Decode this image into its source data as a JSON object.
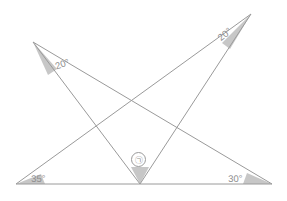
{
  "figure": {
    "width": 287,
    "height": 201,
    "background_color": "#ffffff",
    "line_color": "#9a9a9a",
    "wedge_fill_color": "#bdbdbd",
    "label_color": "#8d8d8d"
  },
  "points": {
    "upper_left": {
      "name": "A",
      "x": 33,
      "y": 42
    },
    "upper_right": {
      "name": "B",
      "x": 251,
      "y": 14
    },
    "bottom_left": {
      "name": "C",
      "x": 16,
      "y": 184
    },
    "bottom_center": {
      "name": "D",
      "x": 140,
      "y": 184
    },
    "bottom_right": {
      "name": "E",
      "x": 272,
      "y": 184
    }
  },
  "segments": [
    {
      "name": "baseline",
      "from": "bottom_left",
      "to": "bottom_right"
    },
    {
      "name": "upper-left-to-center",
      "from": "upper_left",
      "to": "bottom_center"
    },
    {
      "name": "upper-left-to-right",
      "from": "upper_left",
      "to": "bottom_right"
    },
    {
      "name": "upper-right-to-center",
      "from": "upper_right",
      "to": "bottom_center"
    },
    {
      "name": "upper-right-to-left",
      "from": "upper_right",
      "to": "bottom_left"
    }
  ],
  "labels": {
    "upper_left_angle": "20°",
    "upper_right_angle": "20°",
    "bottom_left_angle": "35°",
    "bottom_right_angle": "30°",
    "center_marker": "㉠"
  }
}
